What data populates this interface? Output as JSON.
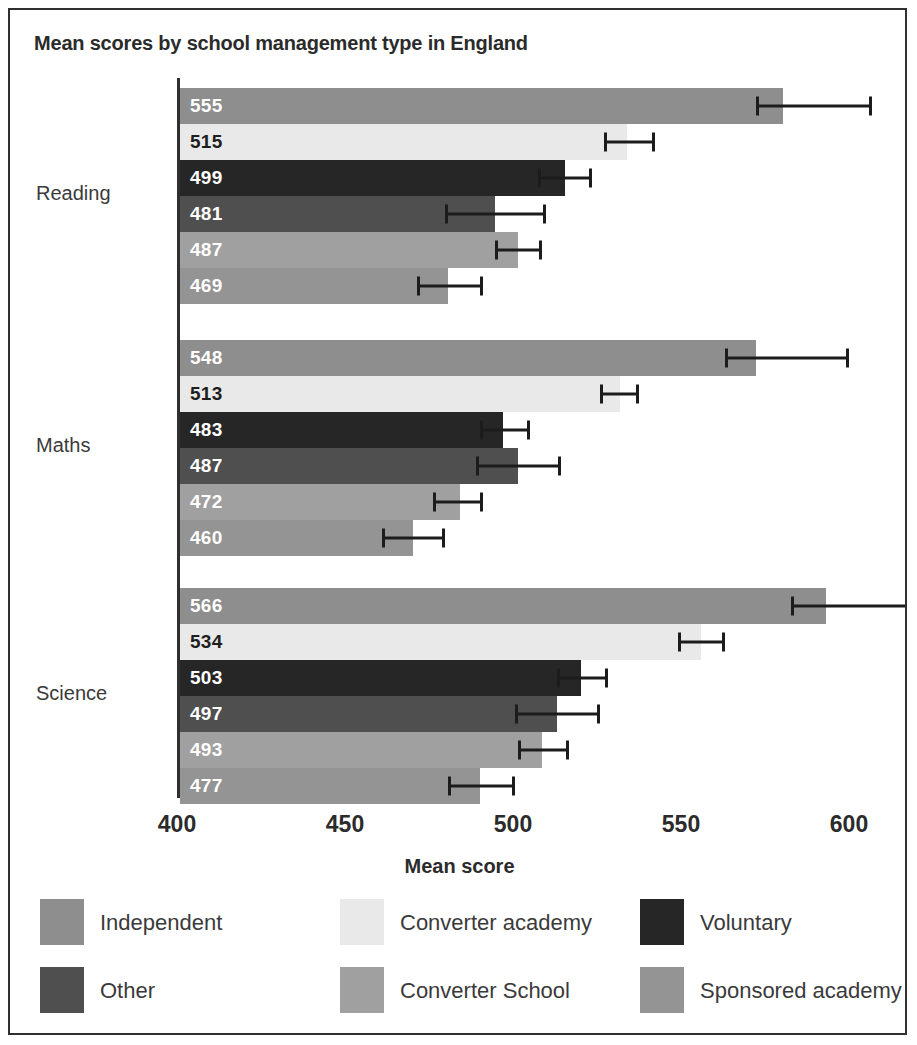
{
  "chart_data": {
    "type": "bar",
    "orientation": "horizontal",
    "title": "Mean scores by school management type in England",
    "xlabel": "Mean score",
    "ylabel": "",
    "xlim": [
      400,
      600
    ],
    "xticks": [
      "400",
      "450",
      "500",
      "550",
      "600"
    ],
    "grid": false,
    "legend_position": "bottom",
    "categories": [
      "Reading",
      "Maths",
      "Science"
    ],
    "series": [
      {
        "name": "Independent",
        "color": "#8e8e8e",
        "label_color": "light",
        "values": [
          555,
          548,
          566
        ],
        "err_low": [
          548,
          540,
          557
        ],
        "err_high": [
          578,
          572,
          588
        ]
      },
      {
        "name": "Converter academy",
        "color": "#e9e9e9",
        "label_color": "dark",
        "values": [
          515,
          513,
          534
        ],
        "err_low": [
          509,
          508,
          528
        ],
        "err_high": [
          522,
          518,
          540
        ]
      },
      {
        "name": "Voluntary",
        "color": "#262626",
        "label_color": "light",
        "values": [
          499,
          483,
          503
        ],
        "err_low": [
          492,
          477,
          497
        ],
        "err_high": [
          506,
          490,
          510
        ]
      },
      {
        "name": "Other",
        "color": "#4f4f4f",
        "label_color": "light",
        "values": [
          481,
          487,
          497
        ],
        "err_low": [
          468,
          476,
          486
        ],
        "err_high": [
          494,
          498,
          508
        ]
      },
      {
        "name": "Converter School",
        "color": "#a0a0a0",
        "label_color": "light",
        "values": [
          487,
          472,
          493
        ],
        "err_low": [
          481,
          465,
          487
        ],
        "err_high": [
          493,
          478,
          500
        ]
      },
      {
        "name": "Sponsored academy",
        "color": "#949494",
        "label_color": "light",
        "values": [
          469,
          460,
          477
        ],
        "err_low": [
          461,
          452,
          469
        ],
        "err_high": [
          478,
          468,
          486
        ]
      }
    ]
  },
  "legend": {
    "items": [
      {
        "label": "Independent",
        "color": "#8e8e8e"
      },
      {
        "label": "Converter academy",
        "color": "#e9e9e9"
      },
      {
        "label": "Voluntary",
        "color": "#262626"
      },
      {
        "label": "Other",
        "color": "#4f4f4f"
      },
      {
        "label": "Converter School",
        "color": "#a0a0a0"
      },
      {
        "label": "Sponsored academy",
        "color": "#949494"
      }
    ]
  }
}
